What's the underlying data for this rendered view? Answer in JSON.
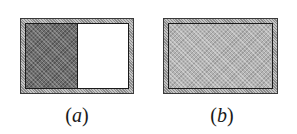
{
  "panels": [
    {
      "id": "a",
      "label": "a",
      "label_display": "(a)",
      "fill": "left-half",
      "fill_fraction": 0.5,
      "fill_color": "#6e6e6e"
    },
    {
      "id": "b",
      "label": "b",
      "label_display": "(b)",
      "fill": "full",
      "fill_fraction": 1.0,
      "fill_color": "#b4b4b4"
    }
  ],
  "glyphs": {
    "open_paren": "(",
    "close_paren": ")"
  },
  "colors": {
    "frame_border": "#3a3a3a",
    "inner_border": "#1a1a1a",
    "background": "#ffffff"
  }
}
